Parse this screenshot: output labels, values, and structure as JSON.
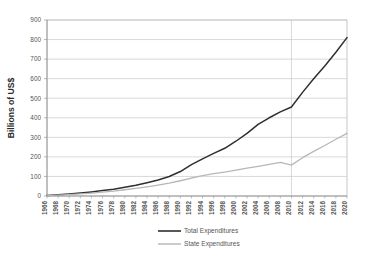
{
  "chart_data": {
    "type": "line",
    "title": "",
    "xlabel": "",
    "ylabel": "Billions of US$",
    "ylim": [
      0,
      900
    ],
    "ytick_step": 100,
    "yticks": [
      0,
      100,
      200,
      300,
      400,
      500,
      600,
      700,
      800,
      900
    ],
    "grid": true,
    "grid_axis": "y",
    "legend_position": "bottom",
    "x": [
      1966,
      1968,
      1970,
      1972,
      1974,
      1976,
      1978,
      1980,
      1982,
      1984,
      1986,
      1988,
      1990,
      1992,
      1994,
      1996,
      1998,
      2000,
      2002,
      2004,
      2006,
      2008,
      2010,
      2012,
      2014,
      2016,
      2018,
      2020
    ],
    "categories": [
      "1966",
      "1968",
      "1970",
      "1972",
      "1974",
      "1976",
      "1978",
      "1980",
      "1982",
      "1984",
      "1986",
      "1988",
      "1990",
      "1992",
      "1994",
      "1996",
      "1998",
      "2000",
      "2002",
      "2004",
      "2006",
      "2008",
      "2010",
      "2012",
      "2014",
      "2016",
      "2018",
      "2020"
    ],
    "vertical_marker": 2010,
    "series": [
      {
        "name": "Total Expenditures",
        "color": "#2f2f2f",
        "width": 1.5,
        "values": [
          3,
          6,
          10,
          15,
          21,
          28,
          35,
          45,
          55,
          68,
          82,
          100,
          125,
          160,
          190,
          218,
          244,
          280,
          320,
          366,
          400,
          430,
          455,
          530,
          600,
          665,
          735,
          810
        ]
      },
      {
        "name": "State Expenditures",
        "color": "#b7b7b7",
        "width": 1.3,
        "values": [
          2,
          4,
          7,
          11,
          15,
          20,
          25,
          32,
          39,
          47,
          56,
          66,
          78,
          92,
          104,
          114,
          122,
          132,
          142,
          152,
          162,
          172,
          158,
          196,
          228,
          258,
          290,
          320
        ]
      }
    ]
  },
  "plot": {
    "left": 47,
    "right": 347,
    "top": 20,
    "bottom": 196,
    "plot_bg": "#ffffff",
    "grid_color": "#c8c8c8",
    "axis_color": "#999999",
    "border_color": "#b0b0b0"
  },
  "legend": {
    "items": [
      {
        "label": "Total Expenditures",
        "color": "#2f2f2f",
        "width": 1.6
      },
      {
        "label": "State Expenditures",
        "color": "#b7b7b7",
        "width": 1.4
      }
    ]
  }
}
